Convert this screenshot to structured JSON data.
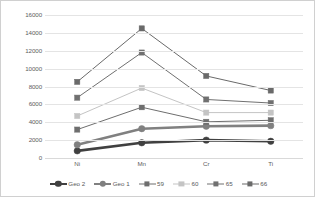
{
  "chart_data": {
    "type": "line",
    "title": "",
    "xlabel": "",
    "ylabel": "",
    "categories": [
      "Ni",
      "Mn",
      "Cr",
      "Ti"
    ],
    "ylim": [
      0,
      16000
    ],
    "yticks": [
      0,
      2000,
      4000,
      6000,
      8000,
      10000,
      12000,
      14000,
      16000
    ],
    "ytick_labels": [
      "0",
      "2000",
      "4000",
      "6000",
      "8000",
      "10000",
      "12000",
      "14000",
      "16000"
    ],
    "grid": true,
    "legend_position": "bottom",
    "series": [
      {
        "name": "Geo 2",
        "values": [
          800,
          1700,
          2000,
          1870
        ],
        "color": "#404040",
        "width": 2.6,
        "marker": "circle",
        "marker_size": 3.2
      },
      {
        "name": "Geo 1",
        "values": [
          1480,
          3280,
          3550,
          3620
        ],
        "color": "#808080",
        "width": 2.6,
        "marker": "circle",
        "marker_size": 3.2
      },
      {
        "name": "59",
        "values": [
          3180,
          5680,
          4050,
          4220
        ],
        "color": "#6e6e6e",
        "width": 1.0,
        "marker": "square",
        "marker_size": 2.6
      },
      {
        "name": "60",
        "values": [
          4700,
          7830,
          5080,
          5080
        ],
        "color": "#c4c4c4",
        "width": 1.0,
        "marker": "square",
        "marker_size": 2.6
      },
      {
        "name": "65",
        "values": [
          6750,
          11800,
          6550,
          6150
        ],
        "color": "#707070",
        "width": 1.0,
        "marker": "square",
        "marker_size": 2.6
      },
      {
        "name": "66",
        "values": [
          8520,
          14500,
          9180,
          7550
        ],
        "color": "#6a6a6a",
        "width": 1.0,
        "marker": "square",
        "marker_size": 2.6
      }
    ]
  }
}
